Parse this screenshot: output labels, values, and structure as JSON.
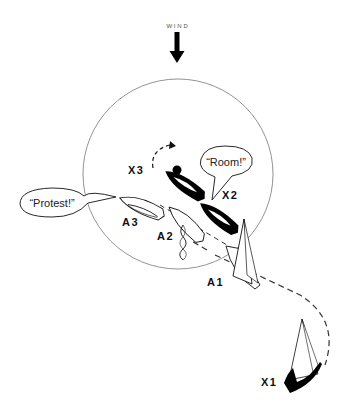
{
  "diagram": {
    "wind": {
      "label": "WIND",
      "icon": "down-arrow-icon"
    },
    "zone_circle": {
      "cx": 178,
      "cy": 174,
      "r": 95,
      "stroke": "#777777"
    },
    "boats": {
      "X1": {
        "label": "X1",
        "color": "#000000"
      },
      "X2": {
        "label": "X2",
        "color": "#000000"
      },
      "X3": {
        "label": "X3",
        "color": "#000000"
      },
      "A1": {
        "label": "A1",
        "color": "#ffffff"
      },
      "A2": {
        "label": "A2",
        "color": "#ffffff"
      },
      "A3": {
        "label": "A3",
        "color": "#ffffff"
      }
    },
    "speech": {
      "room": "“Room!”",
      "protest": "“Protest!”"
    },
    "mark": {
      "icon": "mark-dot-icon"
    },
    "track": {
      "icon": "dashed-track-line"
    }
  }
}
